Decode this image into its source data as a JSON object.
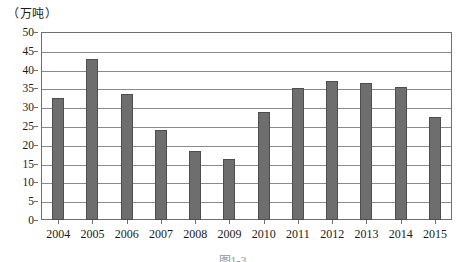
{
  "figure": {
    "unit_label": "（万吨）",
    "caption": "图1-3"
  },
  "chart_data": {
    "type": "bar",
    "title": "",
    "xlabel": "",
    "ylabel": "（万吨）",
    "unit": "万吨",
    "categories": [
      "2004",
      "2005",
      "2006",
      "2007",
      "2008",
      "2009",
      "2010",
      "2011",
      "2012",
      "2013",
      "2014",
      "2015"
    ],
    "values": [
      32.5,
      42.8,
      33.4,
      24.0,
      18.3,
      16.3,
      28.7,
      35.0,
      37.0,
      36.5,
      35.3,
      27.3
    ],
    "ylim": [
      0,
      50
    ],
    "ytick_step": 5,
    "yticks": [
      0,
      5,
      10,
      15,
      20,
      25,
      30,
      35,
      40,
      45,
      50
    ],
    "ytick_labels": [
      "0",
      "5",
      "10",
      "15",
      "20",
      "25",
      "30",
      "35",
      "40",
      "45",
      "50"
    ],
    "grid": true,
    "grid_axis": "y",
    "legend": false,
    "bar_color": "#6e6e6e",
    "bar_border_color": "#4e4e4e",
    "axis_color": "#6f6f6f",
    "gridline_color": "#8a8a8a",
    "background_color": "#ffffff"
  }
}
